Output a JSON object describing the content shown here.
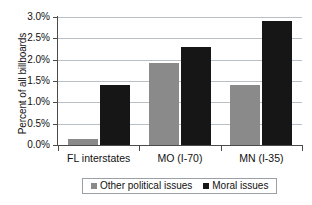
{
  "chart_data": {
    "type": "bar",
    "title": "",
    "xlabel": "",
    "ylabel": "Percent of all billboards",
    "categories": [
      "FL interstates",
      "MO (I-70)",
      "MN (I-35)"
    ],
    "series": [
      {
        "name": "Other political issues",
        "color": "#8a8a8a",
        "values": [
          0.14,
          1.92,
          1.4
        ]
      },
      {
        "name": "Moral issues",
        "color": "#161616",
        "values": [
          1.4,
          2.3,
          2.9
        ]
      }
    ],
    "ylim": [
      0.0,
      3.0
    ],
    "ytick_labels": [
      "3.0%",
      "2.5%",
      "2.0%",
      "1.5%",
      "1.0%",
      "0.5%",
      "0.0%"
    ],
    "ytick_values": [
      3.0,
      2.5,
      2.0,
      1.5,
      1.0,
      0.5,
      0.0
    ],
    "grid": true,
    "legend_position": "bottom",
    "units": "percent",
    "background_color": "#ffffff",
    "axis_color": "#4b4b4b",
    "gridline_color": "#b9bfc6"
  }
}
